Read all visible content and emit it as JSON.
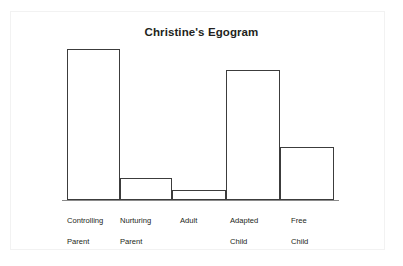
{
  "chart_data": {
    "type": "bar",
    "title": "Christine's Egogram",
    "xlabel": "",
    "ylabel": "",
    "categories": [
      "Controlling Parent",
      "Nurturing Parent",
      "Adult",
      "Adapted Child",
      "Free Child"
    ],
    "category_lines": [
      [
        "Controlling",
        "Parent"
      ],
      [
        "Nurturing",
        "Parent"
      ],
      [
        "Adult",
        ""
      ],
      [
        "Adapted",
        "Child"
      ],
      [
        "Free",
        "Child"
      ]
    ],
    "values": [
      151,
      22,
      10,
      130,
      53
    ],
    "ylim": [
      0,
      160
    ],
    "grid": false,
    "legend": null,
    "bar_fill": "#ffffff",
    "bar_stroke": "#3c3c3c",
    "axis_color": "#8a8a8a",
    "background": "#ffffff",
    "frame_color": "#f2f2f2",
    "text_color": "#231f20"
  }
}
